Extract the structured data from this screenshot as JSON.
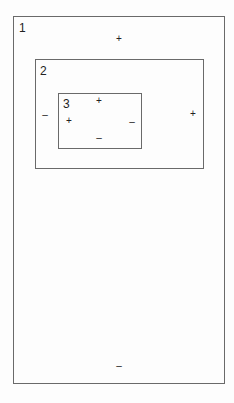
{
  "diagram": {
    "boxes": [
      {
        "id": "1",
        "label": "1"
      },
      {
        "id": "2",
        "label": "2"
      },
      {
        "id": "3",
        "label": "3"
      }
    ],
    "signs": {
      "box1_top": "+",
      "box1_bottom": "–",
      "box2_left": "–",
      "box2_right": "+",
      "box3_top": "+",
      "box3_left": "+",
      "box3_right": "–",
      "box3_bottom": "–"
    }
  }
}
